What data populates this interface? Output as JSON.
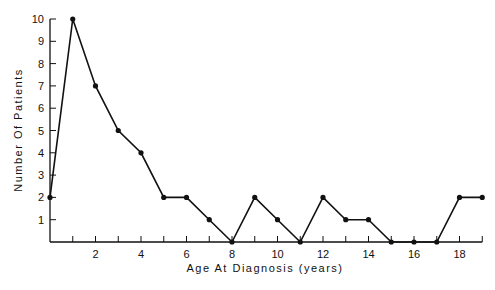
{
  "chart_data": {
    "type": "line",
    "title": "",
    "xlabel": "Age At Diagnosis (years)",
    "ylabel": "Number Of Patients",
    "x": [
      0,
      1,
      2,
      3,
      4,
      5,
      6,
      7,
      8,
      9,
      10,
      11,
      12,
      13,
      14,
      15,
      16,
      17,
      18,
      19
    ],
    "series": [
      {
        "name": "Patients",
        "values": [
          2,
          10,
          7,
          5,
          4,
          2,
          2,
          1,
          0,
          2,
          1,
          0,
          2,
          1,
          1,
          0,
          0,
          0,
          2,
          2
        ]
      }
    ],
    "xticks": [
      2,
      4,
      6,
      8,
      10,
      12,
      14,
      16,
      18
    ],
    "yticks": [
      1,
      2,
      3,
      4,
      5,
      6,
      7,
      8,
      9,
      10
    ],
    "xlim": [
      0,
      19
    ],
    "ylim": [
      0,
      10
    ],
    "grid": false,
    "legend": "none"
  }
}
